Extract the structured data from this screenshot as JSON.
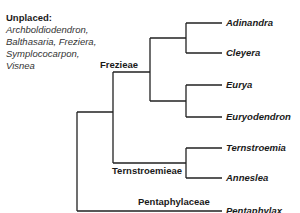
{
  "unplaced": {
    "title": "Unplaced:",
    "lines": [
      "Archboldiodendron,",
      "Balthasaria, Freziera,",
      "Symplococarpon,",
      "Visnea"
    ]
  },
  "clades": {
    "frezieae": "Frezieae",
    "ternstroemieae": "Ternstroemieae",
    "pentaphylaceae": "Pentaphylaceae"
  },
  "taxa": [
    "Adinandra",
    "Cleyera",
    "Eurya",
    "Euryodendron",
    "Ternstroemia",
    "Anneslea",
    "Pentaphylax"
  ],
  "colors": {
    "line": "#222222",
    "text": "#1a1a1a"
  }
}
